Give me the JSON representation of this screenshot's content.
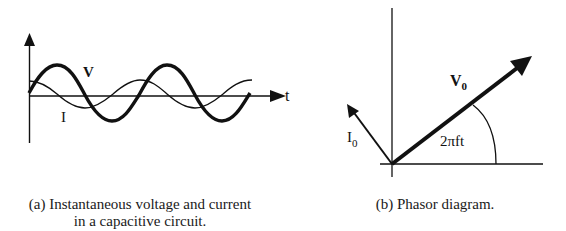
{
  "panel_a": {
    "t_axis_label": "t",
    "voltage_label": "V",
    "current_label": "I",
    "caption_line1": "(a) Instantaneous voltage and current",
    "caption_line2": "in a capacitive circuit."
  },
  "panel_b": {
    "voltage_phasor_label": "V",
    "voltage_phasor_sub": "0",
    "current_phasor_label": "I",
    "current_phasor_sub": "0",
    "angle_label": "2πft",
    "caption": "(b) Phasor diagram."
  },
  "colors": {
    "ink": "#111111",
    "background": "#ffffff"
  }
}
